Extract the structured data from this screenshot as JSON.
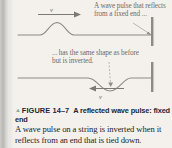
{
  "figure": {
    "annotation_top": "A wave pulse that reflects from a fixed end ...",
    "annotation_bottom": "... has the same shape as before but is inverted.",
    "velocity_label_top": "v",
    "velocity_label_bottom": "v",
    "marker_glyph": "▲",
    "figure_number": "FIGURE 14–7",
    "caption_title": "A reflected wave pulse: fixed end",
    "body_text": "A wave pulse on a string is inverted when it reflects from an end that is tied down."
  },
  "colors": {
    "page_background": "#f4f1ec",
    "string_line": "#8d8a86",
    "wall": "#8e8b87",
    "annotation_text": "#6d6a66",
    "caption_text": "#1d2636",
    "body_text": "#20242c",
    "edge_strip": "#b9b7b4"
  },
  "diagram_data": {
    "type": "physics-wave-diagram",
    "panels": [
      {
        "name": "incident-pulse",
        "pulse_shape": "crest",
        "pulse_direction": "right",
        "pulse_peak_x": 57,
        "baseline_y": 35,
        "amplitude": 13,
        "wall_x": 152,
        "wall_top": 17,
        "wall_bottom": 46
      },
      {
        "name": "reflected-pulse",
        "pulse_shape": "trough",
        "pulse_direction": "left",
        "pulse_trough_x": 110,
        "baseline_y": 78,
        "amplitude": 13,
        "wall_x": 152,
        "wall_top": 62,
        "wall_bottom": 92
      }
    ]
  }
}
